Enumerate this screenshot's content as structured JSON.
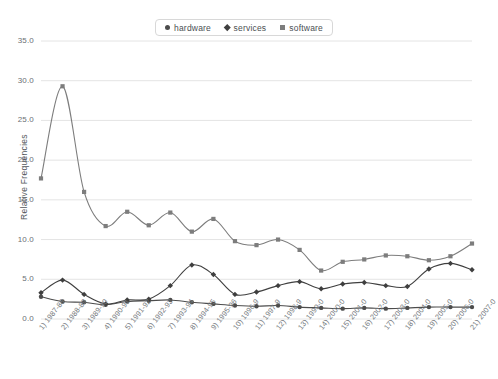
{
  "chart_data": {
    "type": "line",
    "title": "",
    "xlabel": "",
    "ylabel": "Relative Frequencies",
    "ylim": [
      0.0,
      35.0
    ],
    "y_ticks": [
      "0.0",
      "5.0",
      "10.0",
      "15.0",
      "20.0",
      "25.0",
      "30.0",
      "35.0"
    ],
    "y_tick_values": [
      0,
      5,
      10,
      15,
      20,
      25,
      30,
      35
    ],
    "grid": true,
    "legend_position": "top-center",
    "smoothing": "spline",
    "categories": [
      "1) 1987-88",
      "2) 1988-89",
      "3) 1989-90",
      "4) 1990-91",
      "5) 1991-92",
      "6) 1992-93",
      "7) 1993-94",
      "8) 1994-95",
      "9) 1995-96",
      "10) 1996-9",
      "11) 1997-9",
      "12) 1998-9",
      "13) 1999-0",
      "14) 2000-0",
      "15) 2001-0",
      "16) 2002-0",
      "17) 2003-0",
      "18) 2004-0",
      "19) 2005-0",
      "20) 2006-0",
      "21) 2007-0"
    ],
    "series": [
      {
        "name": "hardware",
        "marker": "circle",
        "color": "#4c4c4c",
        "values": [
          2.8,
          2.2,
          2.1,
          1.8,
          2.2,
          2.3,
          2.4,
          2.1,
          1.9,
          1.7,
          1.6,
          1.7,
          1.5,
          1.4,
          1.3,
          1.4,
          1.3,
          1.4,
          1.5,
          1.5,
          1.5
        ]
      },
      {
        "name": "services",
        "marker": "diamond",
        "color": "#3f3f3f",
        "values": [
          3.3,
          4.9,
          3.1,
          1.9,
          2.4,
          2.5,
          4.2,
          6.8,
          5.6,
          3.1,
          3.4,
          4.2,
          4.7,
          3.8,
          4.4,
          4.6,
          4.2,
          4.1,
          6.3,
          7.0,
          6.2
        ]
      },
      {
        "name": "software",
        "marker": "square",
        "color": "#7d7d7d",
        "values": [
          17.7,
          29.3,
          16.0,
          11.7,
          13.5,
          11.8,
          13.4,
          11.0,
          12.6,
          9.8,
          9.3,
          10.0,
          8.7,
          6.1,
          7.2,
          7.5,
          8.0,
          7.9,
          7.4,
          7.9,
          9.5
        ]
      }
    ]
  }
}
